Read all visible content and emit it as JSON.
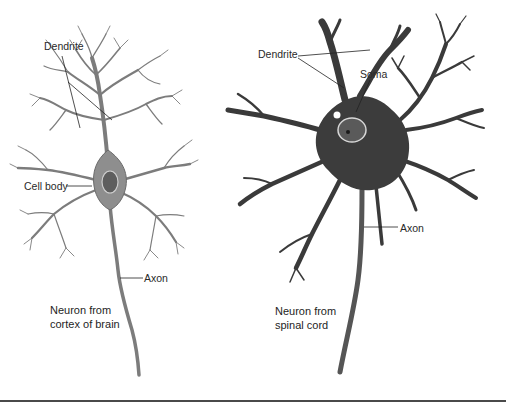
{
  "figure": {
    "left_neuron": {
      "labels": {
        "dendrite": "Dendrite",
        "cell_body": "Cell body",
        "axon": "Axon"
      },
      "caption_line1": "Neuron from",
      "caption_line2": "cortex of brain"
    },
    "right_neuron": {
      "labels": {
        "dendrite": "Dendrite",
        "soma": "Soma",
        "axon": "Axon"
      },
      "caption_line1": "Neuron from",
      "caption_line2": "spinal cord"
    },
    "colors": {
      "background": "#ffffff",
      "left_neuron_fill": "#8a8a8a",
      "right_neuron_fill": "#3c3c3c",
      "text": "#2a2a2a",
      "leader_line": "#222222",
      "bottom_rule": "#4a4a4a"
    }
  }
}
